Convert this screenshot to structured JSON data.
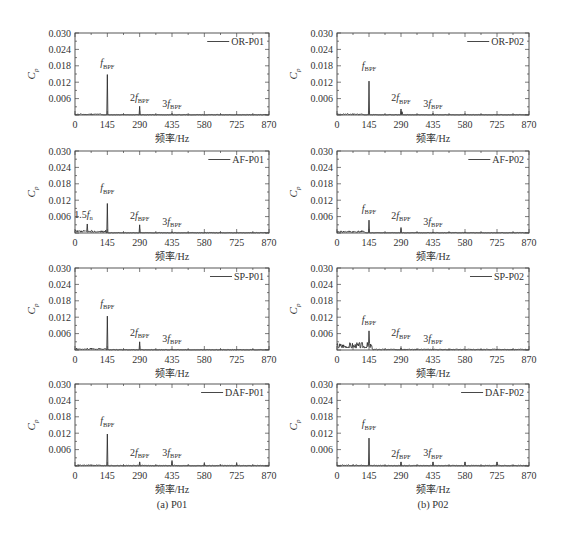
{
  "figure": {
    "captions": [
      "(a) P01",
      "(b) P02"
    ]
  },
  "chart_data": [
    {
      "type": "line",
      "title": "OR-P01",
      "legend": "OR-P01",
      "legend_position": "upper right",
      "xlabel": "频率/Hz",
      "ylabel": "Cp",
      "xlim": [
        0,
        870
      ],
      "ylim": [
        0,
        0.03
      ],
      "xticks": [
        0,
        145,
        290,
        435,
        580,
        725,
        870
      ],
      "yticks": [
        "0.006",
        "0.012",
        "0.018",
        "0.024",
        "0.030"
      ],
      "grid": false,
      "peaks": [
        [
          145,
          0.0148
        ],
        [
          290,
          0.0032
        ],
        [
          435,
          0.0006
        ]
      ],
      "noise": {
        "low_freq_cut": 120,
        "low_amp": 0.0005,
        "high_amp": 0.0002,
        "seed": 11
      },
      "annotations": [
        {
          "prefix": "",
          "main": "f",
          "sub": "BPF",
          "x": 145,
          "y": 0.0178
        },
        {
          "prefix": "2",
          "main": "f",
          "sub": "BPF",
          "x": 290,
          "y": 0.0052
        },
        {
          "prefix": "3",
          "main": "f",
          "sub": "BPF",
          "x": 435,
          "y": 0.0031
        }
      ]
    },
    {
      "type": "line",
      "title": "OR-P02",
      "legend": "OR-P02",
      "legend_position": "upper right",
      "xlabel": "频率/Hz",
      "ylabel": "Cp",
      "xlim": [
        0,
        870
      ],
      "ylim": [
        0,
        0.03
      ],
      "xticks": [
        0,
        145,
        290,
        435,
        580,
        725,
        870
      ],
      "yticks": [
        "0.006",
        "0.012",
        "0.018",
        "0.024",
        "0.030"
      ],
      "grid": false,
      "peaks": [
        [
          145,
          0.0124
        ],
        [
          290,
          0.0022
        ],
        [
          295,
          0.0012
        ],
        [
          435,
          0.0006
        ],
        [
          580,
          0.0005
        ]
      ],
      "noise": {
        "low_freq_cut": 120,
        "low_amp": 0.0005,
        "high_amp": 0.0002,
        "seed": 23
      },
      "annotations": [
        {
          "prefix": "",
          "main": "f",
          "sub": "BPF",
          "x": 145,
          "y": 0.017
        },
        {
          "prefix": "2",
          "main": "f",
          "sub": "BPF",
          "x": 290,
          "y": 0.005
        },
        {
          "prefix": "3",
          "main": "f",
          "sub": "BPF",
          "x": 435,
          "y": 0.003
        }
      ]
    },
    {
      "type": "line",
      "title": "AF-P01",
      "legend": "AF-P01",
      "legend_position": "upper right",
      "xlabel": "频率/Hz",
      "ylabel": "Cp",
      "xlim": [
        0,
        870
      ],
      "ylim": [
        0,
        0.03
      ],
      "xticks": [
        0,
        145,
        290,
        435,
        580,
        725,
        870
      ],
      "yticks": [
        "0.006",
        "0.012",
        "0.018",
        "0.024",
        "0.030"
      ],
      "grid": false,
      "peaks": [
        [
          54,
          0.0033
        ],
        [
          145,
          0.0108
        ],
        [
          290,
          0.003
        ],
        [
          435,
          0.0005
        ]
      ],
      "noise": {
        "low_freq_cut": 140,
        "low_amp": 0.001,
        "high_amp": 0.0002,
        "seed": 37
      },
      "annotations": [
        {
          "prefix": "1.5",
          "main": "f",
          "sub": "n",
          "x": 38,
          "y": 0.0055
        },
        {
          "prefix": "",
          "main": "f",
          "sub": "BPF",
          "x": 145,
          "y": 0.0152
        },
        {
          "prefix": "2",
          "main": "f",
          "sub": "BPF",
          "x": 290,
          "y": 0.0052
        },
        {
          "prefix": "3",
          "main": "f",
          "sub": "BPF",
          "x": 435,
          "y": 0.003
        }
      ]
    },
    {
      "type": "line",
      "title": "AF-P02",
      "legend": "AF-P02",
      "legend_position": "upper right",
      "xlabel": "频率/Hz",
      "ylabel": "Cp",
      "xlim": [
        0,
        870
      ],
      "ylim": [
        0,
        0.03
      ],
      "xticks": [
        0,
        145,
        290,
        435,
        580,
        725,
        870
      ],
      "yticks": [
        "0.006",
        "0.012",
        "0.018",
        "0.024",
        "0.030"
      ],
      "grid": false,
      "peaks": [
        [
          145,
          0.0047
        ],
        [
          290,
          0.002
        ],
        [
          435,
          0.0004
        ],
        [
          580,
          0.0004
        ]
      ],
      "noise": {
        "low_freq_cut": 130,
        "low_amp": 0.0009,
        "high_amp": 0.0002,
        "seed": 41
      },
      "annotations": [
        {
          "prefix": "",
          "main": "f",
          "sub": "BPF",
          "x": 145,
          "y": 0.0078
        },
        {
          "prefix": "2",
          "main": "f",
          "sub": "BPF",
          "x": 290,
          "y": 0.0052
        },
        {
          "prefix": "3",
          "main": "f",
          "sub": "BPF",
          "x": 435,
          "y": 0.0031
        }
      ]
    },
    {
      "type": "line",
      "title": "SP-P01",
      "legend": "SP-P01",
      "legend_position": "upper right",
      "xlabel": "频率/Hz",
      "ylabel": "Cp",
      "xlim": [
        0,
        870
      ],
      "ylim": [
        0,
        0.03
      ],
      "xticks": [
        0,
        145,
        290,
        435,
        580,
        725,
        870
      ],
      "yticks": [
        "0.006",
        "0.012",
        "0.018",
        "0.024",
        "0.030"
      ],
      "grid": false,
      "peaks": [
        [
          145,
          0.0124
        ],
        [
          290,
          0.003
        ],
        [
          435,
          0.0004
        ]
      ],
      "noise": {
        "low_freq_cut": 140,
        "low_amp": 0.0007,
        "high_amp": 0.0002,
        "seed": 53
      },
      "annotations": [
        {
          "prefix": "",
          "main": "f",
          "sub": "BPF",
          "x": 145,
          "y": 0.0158
        },
        {
          "prefix": "2",
          "main": "f",
          "sub": "BPF",
          "x": 290,
          "y": 0.0052
        },
        {
          "prefix": "3",
          "main": "f",
          "sub": "BPF",
          "x": 435,
          "y": 0.003
        }
      ]
    },
    {
      "type": "line",
      "title": "SP-P02",
      "legend": "SP-P02",
      "legend_position": "upper right",
      "xlabel": "频率/Hz",
      "ylabel": "Cp",
      "xlim": [
        0,
        870
      ],
      "ylim": [
        0,
        0.03
      ],
      "xticks": [
        0,
        145,
        290,
        435,
        580,
        725,
        870
      ],
      "yticks": [
        "0.006",
        "0.012",
        "0.018",
        "0.024",
        "0.030"
      ],
      "grid": false,
      "peaks": [
        [
          145,
          0.007
        ],
        [
          290,
          0.0008
        ],
        [
          435,
          0.0004
        ]
      ],
      "noise": {
        "low_freq_cut": 160,
        "low_amp": 0.003,
        "high_amp": 0.0004,
        "seed": 67
      },
      "annotations": [
        {
          "prefix": "",
          "main": "f",
          "sub": "BPF",
          "x": 145,
          "y": 0.01
        },
        {
          "prefix": "2",
          "main": "f",
          "sub": "BPF",
          "x": 290,
          "y": 0.005
        },
        {
          "prefix": "3",
          "main": "f",
          "sub": "BPF",
          "x": 435,
          "y": 0.003
        }
      ]
    },
    {
      "type": "line",
      "title": "DAF-P01",
      "legend": "DAF-P01",
      "legend_position": "upper right",
      "xlabel": "频率/Hz",
      "ylabel": "Cp",
      "xlim": [
        0,
        870
      ],
      "ylim": [
        0,
        0.03
      ],
      "xticks": [
        0,
        145,
        290,
        435,
        580,
        725,
        870
      ],
      "yticks": [
        "0.006",
        "0.012",
        "0.018",
        "0.024",
        "0.030"
      ],
      "grid": false,
      "peaks": [
        [
          145,
          0.0117
        ],
        [
          290,
          0.0015
        ],
        [
          435,
          0.002
        ],
        [
          507,
          0.0004
        ],
        [
          580,
          0.001
        ],
        [
          725,
          0.001
        ]
      ],
      "noise": {
        "low_freq_cut": 120,
        "low_amp": 0.0005,
        "high_amp": 0.0003,
        "seed": 71
      },
      "annotations": [
        {
          "prefix": "",
          "main": "f",
          "sub": "BPF",
          "x": 145,
          "y": 0.0152
        },
        {
          "prefix": "2",
          "main": "f",
          "sub": "BPF",
          "x": 290,
          "y": 0.0038
        },
        {
          "prefix": "3",
          "main": "f",
          "sub": "BPF",
          "x": 435,
          "y": 0.0038
        }
      ]
    },
    {
      "type": "line",
      "title": "DAF-P02",
      "legend": "DAF-P02",
      "legend_position": "upper right",
      "xlabel": "频率/Hz",
      "ylabel": "Cp",
      "xlim": [
        0,
        870
      ],
      "ylim": [
        0,
        0.03
      ],
      "xticks": [
        0,
        145,
        290,
        435,
        580,
        725,
        870
      ],
      "yticks": [
        "0.006",
        "0.012",
        "0.018",
        "0.024",
        "0.030"
      ],
      "grid": false,
      "peaks": [
        [
          145,
          0.0102
        ],
        [
          290,
          0.0015
        ],
        [
          435,
          0.0015
        ],
        [
          580,
          0.0015
        ],
        [
          725,
          0.0015
        ]
      ],
      "noise": {
        "low_freq_cut": 120,
        "low_amp": 0.0005,
        "high_amp": 0.0003,
        "seed": 83
      },
      "annotations": [
        {
          "prefix": "",
          "main": "f",
          "sub": "BPF",
          "x": 145,
          "y": 0.0142
        },
        {
          "prefix": "2",
          "main": "f",
          "sub": "BPF",
          "x": 290,
          "y": 0.0034
        },
        {
          "prefix": "3",
          "main": "f",
          "sub": "BPF",
          "x": 435,
          "y": 0.0036
        }
      ]
    }
  ]
}
